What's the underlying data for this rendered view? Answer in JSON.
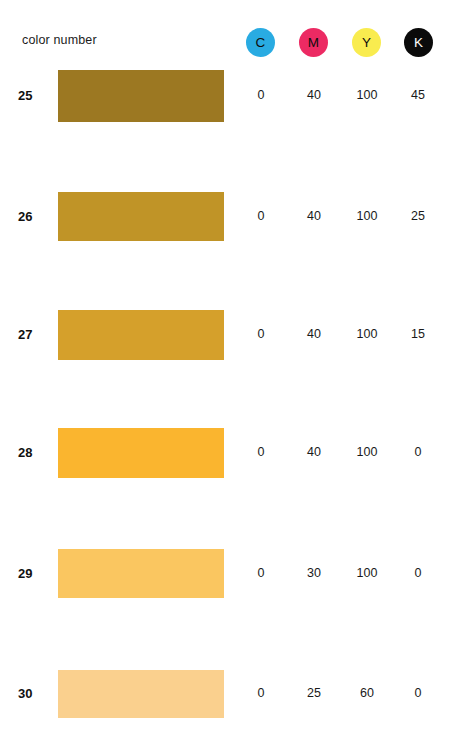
{
  "header": {
    "title": "color number",
    "ink_columns": [
      {
        "key": "C",
        "label": "C",
        "name": "cyan",
        "dot_color": "#29ABE2",
        "letter_color": "#0d0d0d"
      },
      {
        "key": "M",
        "label": "M",
        "name": "magenta",
        "dot_color": "#EC2A63",
        "letter_color": "#0d0d0d"
      },
      {
        "key": "Y",
        "label": "Y",
        "name": "yellow",
        "dot_color": "#F9EC4F",
        "letter_color": "#0d0d0d"
      },
      {
        "key": "K",
        "label": "K",
        "name": "black",
        "dot_color": "#0A0A0A",
        "letter_color": "#ffffff"
      }
    ]
  },
  "chart_data": {
    "type": "table",
    "title": "color number",
    "columns": [
      "color number",
      "C",
      "M",
      "Y",
      "K"
    ],
    "rows": [
      {
        "number": "25",
        "swatch_color": "#9C7822",
        "values": {
          "C": "0",
          "M": "40",
          "Y": "100",
          "K": "45"
        },
        "top": 70,
        "height": 52
      },
      {
        "number": "26",
        "swatch_color": "#C09427",
        "values": {
          "C": "0",
          "M": "40",
          "Y": "100",
          "K": "25"
        },
        "top": 192,
        "height": 49
      },
      {
        "number": "27",
        "swatch_color": "#D5A02B",
        "values": {
          "C": "0",
          "M": "40",
          "Y": "100",
          "K": "15"
        },
        "top": 310,
        "height": 50
      },
      {
        "number": "28",
        "swatch_color": "#FAB52F",
        "values": {
          "C": "0",
          "M": "40",
          "Y": "100",
          "K": "0"
        },
        "top": 428,
        "height": 50
      },
      {
        "number": "29",
        "swatch_color": "#FAC660",
        "values": {
          "C": "0",
          "M": "30",
          "Y": "100",
          "K": "0"
        },
        "top": 549,
        "height": 49
      },
      {
        "number": "30",
        "swatch_color": "#FAD08E",
        "values": {
          "C": "0",
          "M": "25",
          "Y": "60",
          "K": "0"
        },
        "top": 670,
        "height": 48
      }
    ]
  }
}
